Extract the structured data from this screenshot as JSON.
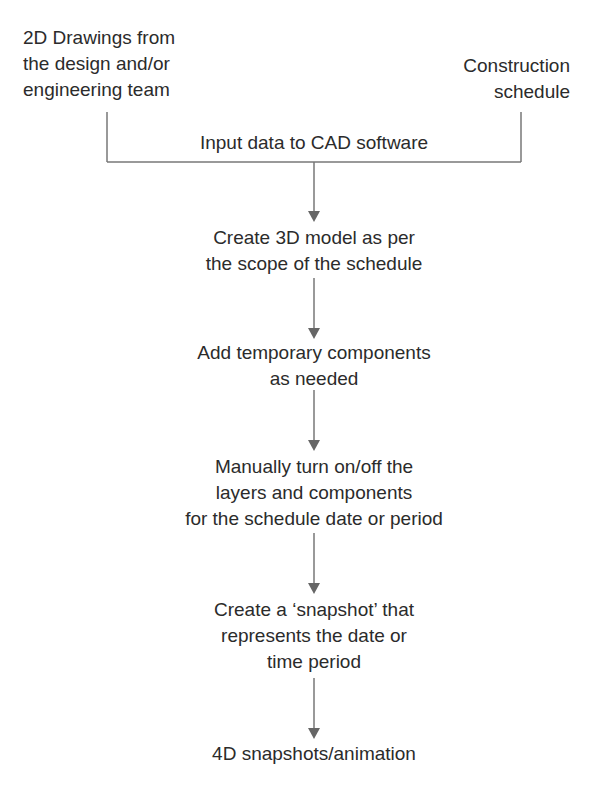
{
  "diagram": {
    "type": "flowchart",
    "inputs": {
      "left": [
        "2D Drawings from",
        "the design and/or",
        "engineering team"
      ],
      "right": [
        "Construction",
        "schedule"
      ]
    },
    "merge_label": "Input data to CAD software",
    "steps": [
      {
        "lines": [
          "Create 3D model as per",
          "the scope of the schedule"
        ]
      },
      {
        "lines": [
          "Add temporary components",
          "as needed"
        ]
      },
      {
        "lines": [
          "Manually turn on/off the",
          "layers and components",
          "for the schedule date or period"
        ]
      },
      {
        "lines": [
          "Create a ‘snapshot’ that",
          "represents the date or",
          "time period"
        ]
      },
      {
        "lines": [
          "4D snapshots/animation"
        ]
      }
    ],
    "colors": {
      "line": "#777777",
      "text": "#2b2b2b",
      "background": "#ffffff"
    }
  }
}
